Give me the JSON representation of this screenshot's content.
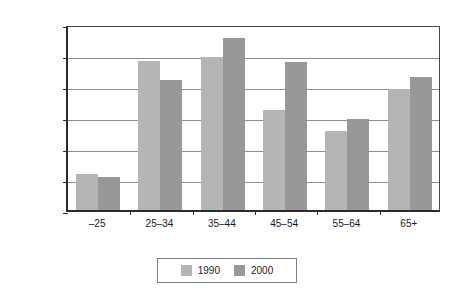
{
  "chart_data": {
    "type": "bar",
    "title": "",
    "subtitle": "",
    "xlabel": "",
    "ylabel": "",
    "categories": [
      "–25",
      "25–34",
      "35–44",
      "45–54",
      "55–64",
      "65+"
    ],
    "series": [
      {
        "name": "1990",
        "color": "#b5b5b5",
        "values": [
          580000,
          2400000,
          2470000,
          1620000,
          1280000,
          1950000
        ]
      },
      {
        "name": "2000",
        "color": "#989898",
        "values": [
          540000,
          2100000,
          2770000,
          2390000,
          1460000,
          2140000
        ]
      }
    ],
    "ylim": [
      0,
      3000000
    ],
    "ytick_values": [
      0,
      500000,
      1000000,
      1500000,
      2000000,
      2500000,
      3000000
    ],
    "ytick_labels": [
      "0",
      "500,000",
      "1,000,000",
      "1,500,000",
      "2,000,000",
      "2,500,000",
      "3,000,000"
    ],
    "grid": true,
    "grid_axis": "y",
    "legend_position": "bottom-center",
    "legend_entries": [
      "1990",
      "2000"
    ]
  },
  "axes": {
    "axis_color": "#2b2b2b",
    "grid_color": "#8c8c8c",
    "frame_color": "#4a4a4a"
  },
  "legend": {
    "border_color": "#808080",
    "background": "#ffffff"
  },
  "canvas": {
    "background": "#ffffff"
  }
}
